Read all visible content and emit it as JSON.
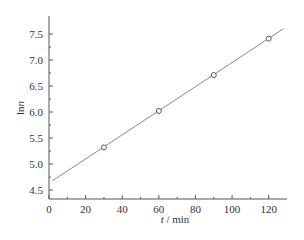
{
  "chart_data": {
    "type": "scatter",
    "title": "",
    "xlabel": "t / min",
    "ylabel": "lnn",
    "xlim": [
      0,
      130
    ],
    "ylim": [
      4.3,
      7.7
    ],
    "xticks": [
      0,
      20,
      40,
      60,
      80,
      100,
      120
    ],
    "yticks": [
      4.5,
      5.0,
      5.5,
      6.0,
      6.5,
      7.0,
      7.5
    ],
    "xtick_labels": [
      "0",
      "20",
      "40",
      "60",
      "80",
      "100",
      "120"
    ],
    "ytick_labels": [
      "4.5",
      "5.0",
      "5.5",
      "6.0",
      "6.5",
      "7.0",
      "7.5"
    ],
    "grid": false,
    "legend": null,
    "series": [
      {
        "name": "data",
        "marker": "open-circle",
        "x": [
          30,
          60,
          90,
          120
        ],
        "y": [
          5.32,
          6.02,
          6.71,
          7.41
        ]
      },
      {
        "name": "linear fit",
        "style": "line",
        "x": [
          2,
          128
        ],
        "y": [
          4.68,
          7.6
        ]
      }
    ],
    "colors": {
      "axis": "#555555",
      "line": "#888888",
      "marker": "#555555"
    }
  }
}
